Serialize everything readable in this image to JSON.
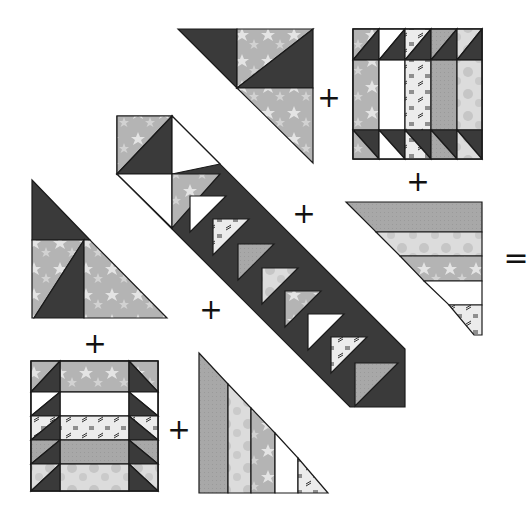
{
  "diagram": {
    "operators": [
      {
        "id": "plus-top",
        "glyph": "+",
        "x": 329,
        "y": 98
      },
      {
        "id": "plus-top-right-below",
        "glyph": "+",
        "x": 418,
        "y": 182
      },
      {
        "id": "plus-center",
        "glyph": "+",
        "x": 304,
        "y": 214
      },
      {
        "id": "equals-right",
        "glyph": "=",
        "x": 516,
        "y": 258
      },
      {
        "id": "plus-left-lower",
        "glyph": "+",
        "x": 211,
        "y": 310
      },
      {
        "id": "plus-left-below",
        "glyph": "+",
        "x": 95,
        "y": 344
      },
      {
        "id": "plus-bottom",
        "glyph": "+",
        "x": 179,
        "y": 430
      }
    ],
    "fabrics": {
      "dark": "#3a3a3a",
      "star_gray": "#b4b4b4",
      "star_light": "#e6e6e6",
      "medium_gray": "#a6a6a6",
      "light_dots": "#d6d6d6",
      "white": "#ffffff",
      "pattern_light": "#e8e8e8",
      "outline": "#1a1a1a"
    },
    "pieces": [
      {
        "id": "top-corner-triangle",
        "label": "Corner setting triangle (top)"
      },
      {
        "id": "top-right-block",
        "label": "Pieced square block (top right)"
      },
      {
        "id": "right-strip-triangle",
        "label": "Strip-pieced side triangle (right)"
      },
      {
        "id": "center-diagonal-strip",
        "label": "Flying geese diagonal strip"
      },
      {
        "id": "left-corner-triangle",
        "label": "Corner setting triangle (left)"
      },
      {
        "id": "bottom-left-block",
        "label": "Pieced square block (bottom left)"
      },
      {
        "id": "bottom-strip-triangle",
        "label": "Strip-pieced side triangle (bottom)"
      }
    ]
  }
}
